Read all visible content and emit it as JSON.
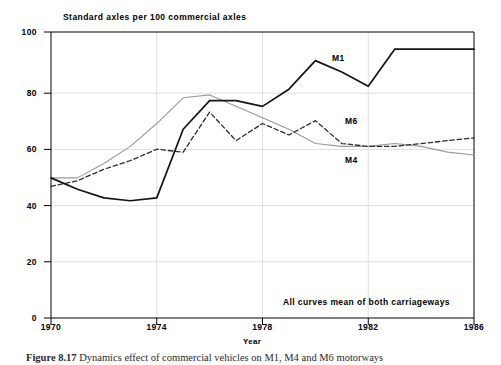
{
  "chart_data": {
    "type": "line",
    "title": "",
    "ylabel": "Standard axles per 100 commercial axles",
    "xlabel": "Year",
    "xlim": [
      1970,
      1986
    ],
    "ylim": [
      0,
      100
    ],
    "xticks": [
      1970,
      1974,
      1978,
      1982,
      1986
    ],
    "yticks": [
      0,
      20,
      40,
      60,
      80,
      100
    ],
    "grid": "light vertical gridlines at x ticks and horizontal gridlines at y ticks",
    "legend_position": "inline labels next to curves",
    "annotation": "All curves mean of both carriageways",
    "x": [
      1970,
      1971,
      1972,
      1973,
      1974,
      1975,
      1976,
      1977,
      1978,
      1979,
      1980,
      1981,
      1982,
      1983,
      1984,
      1985,
      1986
    ],
    "series": [
      {
        "name": "M1",
        "style": "thick solid",
        "label_position": {
          "x": 1980,
          "y": 86
        },
        "values": [
          49,
          45,
          42,
          41,
          42,
          66,
          76,
          76,
          74,
          80,
          90,
          86,
          81,
          94,
          94,
          94,
          94
        ]
      },
      {
        "name": "M6",
        "style": "dashed",
        "label_position": {
          "x": 1981,
          "y": 69
        },
        "values": [
          46,
          48,
          52,
          55,
          59,
          58,
          72,
          62,
          68,
          64,
          69,
          61,
          60,
          60,
          61,
          62,
          63
        ]
      },
      {
        "name": "M4",
        "style": "thin solid",
        "label_position": {
          "x": 1981,
          "y": 55
        },
        "values": [
          49,
          49,
          54,
          60,
          68,
          77,
          78,
          74,
          70,
          66,
          61,
          60,
          60,
          61,
          60,
          58,
          57
        ]
      }
    ]
  },
  "labels": {
    "y_axis_title": "Standard axles per 100 commercial axles",
    "x_axis_title": "Year",
    "note": "All curves mean of both carriageways",
    "y_ticks": [
      "0",
      "20",
      "40",
      "60",
      "80",
      "100"
    ],
    "x_ticks": [
      "1970",
      "1974",
      "1978",
      "1982",
      "1986"
    ],
    "series_names": [
      "M1",
      "M6",
      "M4"
    ]
  },
  "caption": {
    "figure_number": "Figure 8.17",
    "text": "Dynamics effect of commercial vehicles on M1, M4 and M6 motorways"
  },
  "colors": {
    "axis": "#000000",
    "grid": "#cfcfcf",
    "m1": "#1a1a1a",
    "m6": "#333333",
    "m4": "#9a9a9a",
    "background": "#ffffff"
  }
}
